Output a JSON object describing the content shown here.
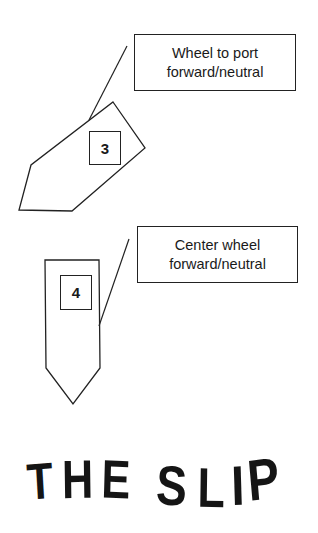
{
  "diagram": {
    "title_letters": [
      "T",
      "H",
      "E",
      "S",
      "L",
      "I",
      "P"
    ],
    "steps": [
      {
        "number": "3",
        "callout": {
          "line1": "Wheel to port",
          "line2": "forward/neutral"
        },
        "boat_orientation": "angled-left-bow-down"
      },
      {
        "number": "4",
        "callout": {
          "line1": "Center wheel",
          "line2": "forward/neutral"
        },
        "boat_orientation": "straight-bow-down"
      }
    ],
    "colors": {
      "stroke": "#222222",
      "text": "#1a1a1a",
      "background": "#ffffff"
    }
  }
}
